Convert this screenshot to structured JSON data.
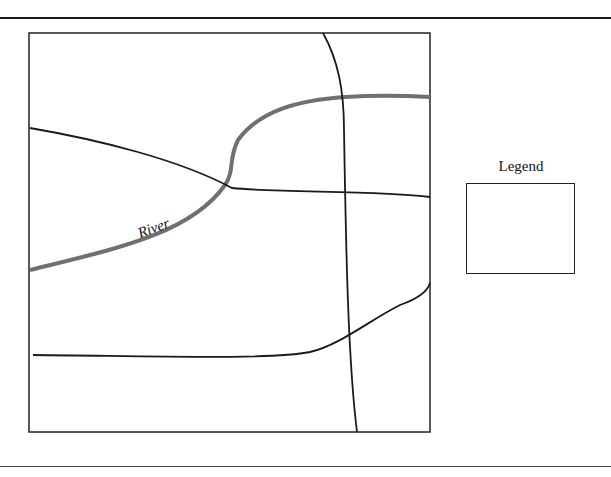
{
  "map": {
    "labels": {
      "river": "River"
    },
    "colors": {
      "road": "#1a1a1a",
      "river": "#707070",
      "frame": "#222222"
    }
  },
  "legend": {
    "title": "Legend"
  }
}
